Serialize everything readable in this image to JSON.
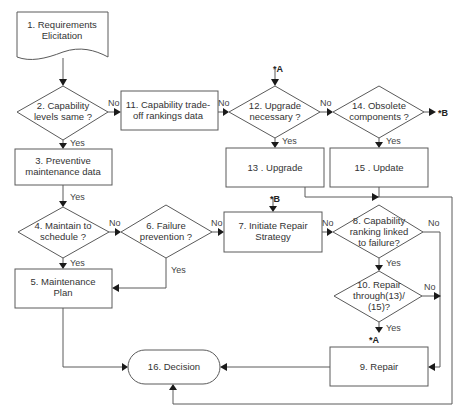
{
  "diagram": {
    "type": "flowchart",
    "nodes": {
      "n1": {
        "shape": "document",
        "lines": [
          "1. Requirements",
          "Elicitation"
        ]
      },
      "n2": {
        "shape": "decision",
        "lines": [
          "2. Capability",
          "levels same ?"
        ]
      },
      "n3": {
        "shape": "process",
        "lines": [
          "3. Preventive",
          "maintenance data"
        ]
      },
      "n4": {
        "shape": "decision",
        "lines": [
          "4. Maintain to",
          "schedule ?"
        ]
      },
      "n5": {
        "shape": "process",
        "lines": [
          "5. Maintenance",
          "Plan"
        ]
      },
      "n6": {
        "shape": "decision",
        "lines": [
          "6. Failure",
          "prevention ?"
        ]
      },
      "n7": {
        "shape": "process",
        "lines": [
          "7. Initiate Repair",
          "Strategy"
        ]
      },
      "n8": {
        "shape": "decision",
        "lines": [
          "8. Capability",
          "ranking linked",
          "to failure?"
        ]
      },
      "n9": {
        "shape": "process",
        "lines": [
          "9. Repair"
        ]
      },
      "n10": {
        "shape": "decision",
        "lines": [
          "10. Repair",
          "through(13)/",
          "(15)?"
        ]
      },
      "n11": {
        "shape": "process",
        "lines": [
          "11. Capability trade-",
          "off rankings data"
        ]
      },
      "n12": {
        "shape": "decision",
        "lines": [
          "12. Upgrade",
          "necessary ?"
        ]
      },
      "n13": {
        "shape": "process",
        "lines": [
          "13 . Upgrade"
        ]
      },
      "n14": {
        "shape": "decision",
        "lines": [
          "14. Obsolete",
          "components ?"
        ]
      },
      "n15": {
        "shape": "process",
        "lines": [
          "15 . Update"
        ]
      },
      "n16": {
        "shape": "terminator",
        "lines": [
          "16. Decision"
        ]
      }
    },
    "edge_labels": {
      "n2_no": "No",
      "n2_yes": "Yes",
      "n3_yes": "Yes",
      "n4_no": "No",
      "n4_yes": "Yes",
      "n6_no": "No",
      "n6_yes": "Yes",
      "n7_no": "No",
      "n8_no": "No",
      "n8_yes": "Yes",
      "n10_no": "No",
      "n10_yes": "Yes",
      "n11_no": "No",
      "n12_no": "No",
      "n12_yes": "Yes",
      "n14_yes": "Yes"
    },
    "connectors": {
      "a_in": "*A",
      "a_out": "*A",
      "b_in": "*B",
      "b_out": "*B"
    },
    "edges": [
      {
        "from": "n1",
        "to": "n2"
      },
      {
        "from": "n2",
        "to": "n11",
        "label": "No"
      },
      {
        "from": "n2",
        "to": "n3",
        "label": "Yes"
      },
      {
        "from": "n11",
        "to": "n12",
        "label": "No"
      },
      {
        "from": "n12",
        "to": "n14",
        "label": "No"
      },
      {
        "from": "n12",
        "to": "n13",
        "label": "Yes"
      },
      {
        "from": "n14",
        "to": "B",
        "label": ""
      },
      {
        "from": "n14",
        "to": "n15",
        "label": "Yes"
      },
      {
        "from": "n3",
        "to": "n4",
        "label": "Yes"
      },
      {
        "from": "n4",
        "to": "n6",
        "label": "No"
      },
      {
        "from": "n4",
        "to": "n5",
        "label": "Yes"
      },
      {
        "from": "n6",
        "to": "n7",
        "label": "No"
      },
      {
        "from": "n6",
        "to": "n5",
        "label": "Yes"
      },
      {
        "from": "B",
        "to": "n7",
        "label": ""
      },
      {
        "from": "n7",
        "to": "n8",
        "label": "No"
      },
      {
        "from": "n8",
        "to": "n9",
        "label": "No"
      },
      {
        "from": "n8",
        "to": "n10",
        "label": "Yes"
      },
      {
        "from": "n10",
        "to": "n9",
        "label": "No"
      },
      {
        "from": "n10",
        "to": "A",
        "label": "Yes"
      },
      {
        "from": "A",
        "to": "n12",
        "label": ""
      },
      {
        "from": "n5",
        "to": "n16"
      },
      {
        "from": "n9",
        "to": "n16"
      },
      {
        "from": "n13",
        "to": "n16"
      },
      {
        "from": "n15",
        "to": "n16"
      }
    ]
  }
}
